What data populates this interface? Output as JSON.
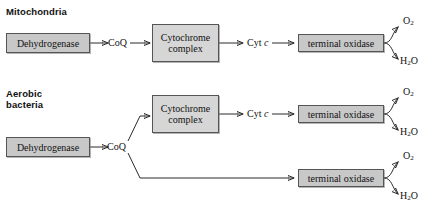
{
  "figure": {
    "sections": [
      {
        "id": "mitochondria",
        "title": "Mitochondria"
      },
      {
        "id": "aerobic-bacteria",
        "title": "Aerobic\nbacteria"
      }
    ],
    "labels": {
      "dehydrogenase": "Dehydrogenase",
      "coq": "CoQ",
      "cytochrome_complex": "Cytochrome\ncomplex",
      "cytochrome_complex_line1": "Cytochrome",
      "cytochrome_complex_line2": "complex",
      "cyt_c_prefix": "Cyt ",
      "cyt_c_italic": "c",
      "terminal_oxidase": "terminal oxidase",
      "oxygen": "O",
      "oxygen_sub": "2",
      "water_h": "H",
      "water_sub": "2",
      "water_o": "O"
    },
    "colors": {
      "box_fill": "#c8c8c8",
      "box_fill_light": "#d6d6d6",
      "box_border": "#555555",
      "arrow": "#2b2b2b",
      "text": "#111111",
      "background": "#ffffff"
    },
    "pathways": [
      {
        "name": "mitochondrial-electron-transport-chain",
        "chain": [
          "Dehydrogenase",
          "CoQ",
          "Cytochrome complex",
          "Cyt c",
          "terminal oxidase"
        ],
        "products": [
          "O2",
          "H2O"
        ]
      },
      {
        "name": "bacterial-branched-chain-cytochrome-route",
        "chain": [
          "Dehydrogenase",
          "CoQ",
          "Cytochrome complex",
          "Cyt c",
          "terminal oxidase"
        ],
        "products": [
          "O2",
          "H2O"
        ]
      },
      {
        "name": "bacterial-branched-chain-direct-route",
        "chain": [
          "Dehydrogenase",
          "CoQ",
          "terminal oxidase"
        ],
        "products": [
          "O2",
          "H2O"
        ]
      }
    ]
  }
}
